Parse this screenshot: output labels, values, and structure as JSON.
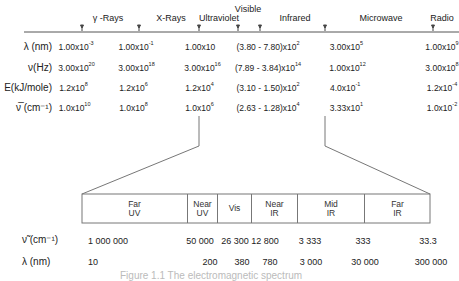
{
  "top_scale": {
    "regions": [
      {
        "name": "γ -Rays",
        "x": 108
      },
      {
        "name": "X-Rays",
        "x": 171
      },
      {
        "name": "Ultraviolet",
        "x": 219
      },
      {
        "name": "Visible",
        "x": 248
      },
      {
        "name": "Infrared",
        "x": 295
      },
      {
        "name": "Microwave",
        "x": 381
      },
      {
        "name": "Radio",
        "x": 442
      }
    ],
    "tick_x": [
      82,
      139,
      199,
      238,
      260,
      325,
      433
    ]
  },
  "rows": [
    {
      "label": "λ (nm)",
      "values": [
        {
          "m": "1.00x10",
          "e": "-3"
        },
        {
          "m": "1.00x10",
          "e": "-1"
        },
        {
          "m": "1.00x10",
          "e": ""
        },
        {
          "m": "(3.80  -  7.80)x10",
          "e": "2"
        },
        {
          "m": "3.00x10",
          "e": "5"
        },
        {
          "m": "1.00x10",
          "e": "9"
        }
      ]
    },
    {
      "label": "ν(Hz)",
      "values": [
        {
          "m": "3.00x10",
          "e": "20"
        },
        {
          "m": "3.00x10",
          "e": "18"
        },
        {
          "m": "3.00x10",
          "e": "16"
        },
        {
          "m": "(7.89  -  3.84)x10",
          "e": "14"
        },
        {
          "m": "1.00x10",
          "e": "12"
        },
        {
          "m": "3.00x10",
          "e": "8"
        }
      ]
    },
    {
      "label": "E(kJ/mole)",
      "values": [
        {
          "m": "1.2x10",
          "e": "8"
        },
        {
          "m": "1.2x10",
          "e": "6"
        },
        {
          "m": "1.2x10",
          "e": "4"
        },
        {
          "m": "(3.10  -  1.50)x10",
          "e": "2"
        },
        {
          "m": "4.0x10",
          "e": "-1"
        },
        {
          "m": "1.2x10",
          "e": "-4"
        }
      ]
    },
    {
      "label": "ν̅  (cm⁻¹)",
      "values": [
        {
          "m": "1.0x10",
          "e": "10"
        },
        {
          "m": "1.0x10",
          "e": "8"
        },
        {
          "m": "1.0x10",
          "e": "6"
        },
        {
          "m": "(2.63 - 1.28)x10",
          "e": "4"
        },
        {
          "m": "3.33x10",
          "e": "1"
        },
        {
          "m": "1.0x10",
          "e": "-2"
        }
      ]
    }
  ],
  "expanded": {
    "regions": [
      {
        "line1": "Far",
        "line2": "UV"
      },
      {
        "line1": "Near",
        "line2": "UV"
      },
      {
        "line1": "Vis",
        "line2": ""
      },
      {
        "line1": "Near",
        "line2": "IR"
      },
      {
        "line1": "Mid",
        "line2": "IR"
      },
      {
        "line1": "Far",
        "line2": "IR"
      }
    ],
    "wavenumber_label": "ν̃  (cm⁻¹)",
    "wavenumber_values": [
      "1 000 000",
      "50 000",
      "26 300",
      "12 800",
      "3 333",
      "333",
      "33.3"
    ],
    "wavelength_label": "λ (nm)",
    "wavelength_values": [
      "10",
      "200",
      "380",
      "780",
      "3 000",
      "30 000",
      "300 000"
    ]
  },
  "caption": "Figure 1.1  The electromagnetic spectrum"
}
